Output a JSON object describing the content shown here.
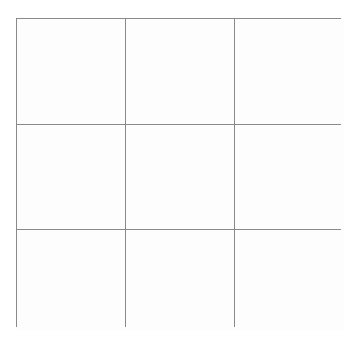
{
  "figure": {
    "kind": "grid-table",
    "rows": 3,
    "columns": 3,
    "background_color": "#ffffff",
    "line_color": "#8a8a8a",
    "cell_fill_color": "#fefefe",
    "line_width_px": 1
  },
  "grid": {
    "cells": [
      {
        "row": 1,
        "column": 1,
        "text": ""
      },
      {
        "row": 1,
        "column": 2,
        "text": ""
      },
      {
        "row": 1,
        "column": 3,
        "text": ""
      },
      {
        "row": 2,
        "column": 1,
        "text": ""
      },
      {
        "row": 2,
        "column": 2,
        "text": ""
      },
      {
        "row": 2,
        "column": 3,
        "text": ""
      },
      {
        "row": 3,
        "column": 1,
        "text": ""
      },
      {
        "row": 3,
        "column": 2,
        "text": ""
      },
      {
        "row": 3,
        "column": 3,
        "text": ""
      }
    ]
  }
}
